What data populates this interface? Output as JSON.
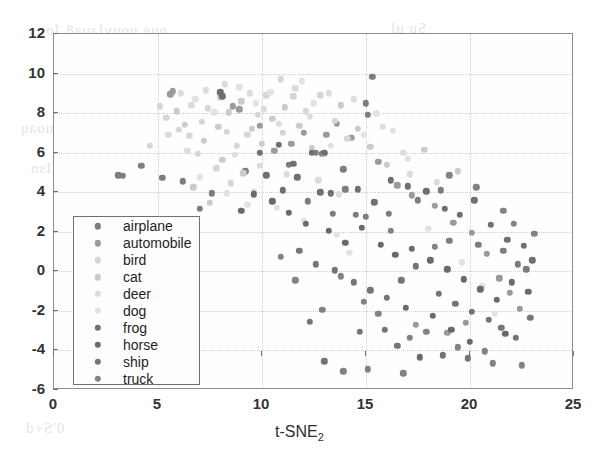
{
  "chart_data": {
    "type": "scatter",
    "title": "",
    "xlabel": "t-SNE",
    "xlabel_sub": "2",
    "ylabel": "",
    "xlim": [
      0,
      25
    ],
    "ylim": [
      -6,
      12
    ],
    "xticks": [
      "0",
      "5",
      "10",
      "15",
      "20",
      "25"
    ],
    "yticks": [
      "12",
      "10",
      "8",
      "6",
      "4",
      "2",
      "0",
      "-2",
      "-4",
      "-6"
    ],
    "xtick_values": [
      0,
      5,
      10,
      15,
      20,
      25
    ],
    "ytick_values": [
      12,
      10,
      8,
      6,
      4,
      2,
      0,
      -2,
      -4,
      -6
    ],
    "grid": true,
    "legend_position": "lower-left",
    "series": [
      {
        "name": "airplane",
        "color": "#7d7d7d",
        "points": [
          [
            3.1,
            4.85
          ],
          [
            3.3,
            4.82
          ],
          [
            4.2,
            5.35
          ],
          [
            5.2,
            4.72
          ],
          [
            6.2,
            4.55
          ],
          [
            7.0,
            3.15
          ],
          [
            7.6,
            3.95
          ],
          [
            9.2,
            5.05
          ],
          [
            11.3,
            5.4
          ],
          [
            12.6,
            6.0
          ],
          [
            12.9,
            5.95
          ],
          [
            13.9,
            5.15
          ],
          [
            14.0,
            4.15
          ],
          [
            15.3,
            9.85
          ],
          [
            15.0,
            8.5
          ],
          [
            15.1,
            7.9
          ],
          [
            12.2,
            3.55
          ],
          [
            13.4,
            2.9
          ],
          [
            14.5,
            2.85
          ],
          [
            15.0,
            2.75
          ],
          [
            16.1,
            2.9
          ],
          [
            17.5,
            3.6
          ],
          [
            18.6,
            4.1
          ],
          [
            19.0,
            1.55
          ],
          [
            20.4,
            1.35
          ],
          [
            21.6,
            1.05
          ],
          [
            22.3,
            0.35
          ],
          [
            22.7,
            0.1
          ]
        ]
      },
      {
        "name": "automobile",
        "color": "#9a9a9a",
        "points": [
          [
            5.6,
            8.95
          ],
          [
            5.7,
            9.1
          ],
          [
            8.6,
            8.35
          ],
          [
            8.9,
            8.2
          ],
          [
            9.9,
            7.35
          ],
          [
            10.6,
            6.1
          ],
          [
            11.4,
            6.45
          ],
          [
            12.0,
            7.0
          ],
          [
            13.1,
            6.9
          ],
          [
            13.6,
            7.45
          ],
          [
            14.3,
            6.75
          ],
          [
            15.6,
            5.55
          ],
          [
            16.5,
            4.35
          ],
          [
            17.2,
            3.85
          ],
          [
            18.3,
            3.3
          ],
          [
            19.2,
            2.45
          ],
          [
            20.1,
            1.95
          ],
          [
            20.8,
            0.9
          ],
          [
            21.4,
            -0.35
          ],
          [
            21.9,
            -1.1
          ],
          [
            22.4,
            -1.9
          ],
          [
            19.8,
            -2.6
          ],
          [
            18.9,
            -3.1
          ],
          [
            17.4,
            -2.7
          ]
        ]
      },
      {
        "name": "bird",
        "color": "#d6d6d6",
        "points": [
          [
            5.1,
            8.35
          ],
          [
            5.4,
            7.75
          ],
          [
            6.0,
            7.15
          ],
          [
            6.5,
            6.85
          ],
          [
            7.1,
            7.55
          ],
          [
            7.4,
            8.25
          ],
          [
            8.0,
            8.8
          ],
          [
            8.3,
            7.05
          ],
          [
            8.8,
            6.35
          ],
          [
            9.3,
            6.9
          ],
          [
            9.8,
            7.9
          ],
          [
            10.2,
            8.9
          ],
          [
            10.9,
            9.7
          ],
          [
            11.5,
            8.85
          ],
          [
            12.1,
            8.1
          ],
          [
            12.8,
            8.9
          ],
          [
            13.5,
            7.6
          ],
          [
            14.1,
            6.7
          ],
          [
            6.9,
            5.95
          ],
          [
            7.8,
            5.2
          ],
          [
            8.5,
            4.45
          ],
          [
            9.6,
            4.0
          ],
          [
            4.6,
            6.35
          ],
          [
            11.0,
            7.0
          ]
        ]
      },
      {
        "name": "cat",
        "color": "#cbcbcb",
        "points": [
          [
            5.9,
            8.1
          ],
          [
            6.3,
            7.4
          ],
          [
            7.2,
            6.6
          ],
          [
            7.9,
            7.3
          ],
          [
            8.4,
            8.05
          ],
          [
            9.0,
            8.6
          ],
          [
            9.5,
            7.2
          ],
          [
            10.0,
            6.45
          ],
          [
            10.5,
            7.7
          ],
          [
            11.1,
            8.3
          ],
          [
            11.8,
            7.35
          ],
          [
            12.4,
            6.25
          ],
          [
            13.0,
            5.95
          ],
          [
            13.8,
            8.4
          ],
          [
            14.6,
            7.2
          ],
          [
            15.2,
            6.3
          ],
          [
            16.0,
            5.4
          ],
          [
            8.1,
            5.65
          ],
          [
            9.1,
            4.95
          ],
          [
            6.7,
            4.25
          ],
          [
            7.5,
            3.45
          ],
          [
            17.8,
            6.15
          ],
          [
            19.4,
            5.05
          ]
        ]
      },
      {
        "name": "deer",
        "color": "#dcdcdc",
        "points": [
          [
            6.1,
            9.0
          ],
          [
            6.6,
            8.4
          ],
          [
            7.3,
            9.15
          ],
          [
            8.2,
            9.45
          ],
          [
            9.4,
            9.0
          ],
          [
            10.1,
            8.2
          ],
          [
            10.8,
            7.45
          ],
          [
            11.6,
            9.25
          ],
          [
            12.3,
            7.8
          ],
          [
            13.2,
            9.0
          ],
          [
            14.4,
            8.7
          ],
          [
            15.8,
            7.3
          ],
          [
            16.8,
            6.0
          ],
          [
            8.7,
            5.9
          ],
          [
            9.9,
            5.35
          ],
          [
            11.2,
            4.9
          ],
          [
            12.7,
            4.6
          ],
          [
            5.5,
            6.9
          ],
          [
            6.4,
            6.1
          ],
          [
            17.1,
            4.9
          ],
          [
            18.4,
            4.5
          ],
          [
            13.7,
            3.9
          ]
        ]
      },
      {
        "name": "dog",
        "color": "#e2e2e2",
        "points": [
          [
            6.8,
            8.7
          ],
          [
            7.7,
            8.05
          ],
          [
            8.9,
            9.3
          ],
          [
            9.7,
            8.5
          ],
          [
            10.4,
            9.05
          ],
          [
            11.9,
            9.6
          ],
          [
            12.5,
            8.5
          ],
          [
            13.3,
            6.35
          ],
          [
            14.9,
            6.9
          ],
          [
            15.5,
            8.0
          ],
          [
            16.3,
            7.1
          ],
          [
            17.0,
            5.7
          ],
          [
            7.0,
            4.75
          ],
          [
            8.3,
            3.95
          ],
          [
            9.3,
            3.35
          ],
          [
            10.7,
            3.2
          ],
          [
            12.0,
            2.55
          ],
          [
            13.6,
            1.85
          ],
          [
            14.2,
            0.95
          ],
          [
            18.0,
            2.15
          ],
          [
            19.6,
            0.45
          ],
          [
            20.6,
            -0.75
          ],
          [
            21.2,
            -2.15
          ]
        ]
      },
      {
        "name": "frog",
        "color": "#707070",
        "points": [
          [
            8.0,
            9.05
          ],
          [
            8.1,
            8.85
          ],
          [
            9.9,
            6.0
          ],
          [
            10.8,
            6.4
          ],
          [
            11.5,
            5.45
          ],
          [
            12.4,
            6.0
          ],
          [
            13.0,
            6.0
          ],
          [
            10.2,
            4.85
          ],
          [
            11.0,
            4.1
          ],
          [
            11.7,
            4.75
          ],
          [
            12.8,
            4.0
          ],
          [
            13.3,
            3.95
          ],
          [
            14.6,
            4.15
          ],
          [
            15.4,
            3.5
          ],
          [
            16.2,
            4.6
          ],
          [
            17.0,
            4.3
          ],
          [
            17.9,
            4.05
          ],
          [
            18.8,
            3.15
          ],
          [
            19.5,
            2.85
          ],
          [
            20.2,
            3.6
          ],
          [
            21.0,
            2.35
          ],
          [
            21.8,
            1.6
          ],
          [
            22.6,
            1.3
          ],
          [
            23.0,
            0.55
          ]
        ]
      },
      {
        "name": "horse",
        "color": "#6a6a6a",
        "points": [
          [
            9.0,
            3.05
          ],
          [
            9.6,
            3.9
          ],
          [
            10.5,
            3.55
          ],
          [
            11.3,
            2.95
          ],
          [
            12.1,
            2.4
          ],
          [
            13.2,
            2.05
          ],
          [
            14.0,
            1.45
          ],
          [
            14.8,
            2.2
          ],
          [
            15.7,
            1.35
          ],
          [
            16.4,
            0.85
          ],
          [
            17.2,
            1.15
          ],
          [
            18.1,
            0.55
          ],
          [
            18.9,
            0.1
          ],
          [
            19.7,
            -0.4
          ],
          [
            20.5,
            -0.9
          ],
          [
            21.3,
            -1.45
          ],
          [
            22.0,
            -0.55
          ],
          [
            22.8,
            -1.05
          ],
          [
            16.9,
            -1.85
          ],
          [
            18.2,
            -2.25
          ],
          [
            19.1,
            -2.95
          ],
          [
            20.0,
            -3.55
          ],
          [
            17.6,
            -4.35
          ],
          [
            21.7,
            -3.15
          ]
        ]
      },
      {
        "name": "ship",
        "color": "#757575",
        "points": [
          [
            11.8,
            1.05
          ],
          [
            12.6,
            0.35
          ],
          [
            13.5,
            0.05
          ],
          [
            14.4,
            -0.55
          ],
          [
            15.2,
            -0.95
          ],
          [
            16.0,
            -1.35
          ],
          [
            16.7,
            -0.45
          ],
          [
            17.4,
            0.25
          ],
          [
            18.5,
            -1.15
          ],
          [
            19.3,
            -1.65
          ],
          [
            20.1,
            -2.05
          ],
          [
            20.9,
            -2.45
          ],
          [
            21.5,
            -2.85
          ],
          [
            22.2,
            -3.35
          ],
          [
            22.9,
            -2.35
          ],
          [
            15.9,
            -2.95
          ],
          [
            14.7,
            -3.05
          ],
          [
            16.5,
            -3.75
          ],
          [
            18.7,
            -4.25
          ],
          [
            19.9,
            -4.4
          ],
          [
            13.0,
            -4.55
          ],
          [
            12.3,
            -2.55
          ]
        ]
      },
      {
        "name": "truck",
        "color": "#828282",
        "points": [
          [
            13.8,
            -0.25
          ],
          [
            14.9,
            -1.55
          ],
          [
            15.6,
            -2.15
          ],
          [
            17.1,
            -3.35
          ],
          [
            17.9,
            -3.05
          ],
          [
            19.4,
            -3.85
          ],
          [
            20.7,
            -4.05
          ],
          [
            21.1,
            -4.65
          ],
          [
            22.5,
            -4.75
          ],
          [
            12.9,
            -1.95
          ],
          [
            11.6,
            -0.45
          ],
          [
            10.9,
            0.75
          ],
          [
            16.2,
            2.05
          ],
          [
            18.3,
            1.25
          ],
          [
            19.0,
            4.85
          ],
          [
            20.3,
            4.25
          ],
          [
            21.6,
            3.05
          ],
          [
            22.1,
            2.4
          ],
          [
            23.1,
            1.9
          ],
          [
            13.9,
            -5.05
          ],
          [
            15.1,
            -4.95
          ],
          [
            16.8,
            -5.15
          ]
        ]
      }
    ],
    "legend_entries": [
      {
        "label": "airplane"
      },
      {
        "label": "automobile"
      },
      {
        "label": "bird"
      },
      {
        "label": "cat"
      },
      {
        "label": "deer"
      },
      {
        "label": "dog"
      },
      {
        "label": "frog"
      },
      {
        "label": "horse"
      },
      {
        "label": "ship"
      },
      {
        "label": "truck"
      }
    ]
  },
  "figure": {
    "background": "#ffffff",
    "axis_color": "#8d8d8d",
    "grid_color": "#cfcfcf"
  }
}
